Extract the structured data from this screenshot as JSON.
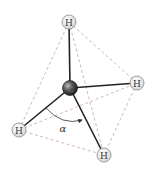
{
  "diagram": {
    "colors": {
      "bond": "#222222",
      "edge_dashed": "#c9a3a3",
      "hydrogen_fill": "#e6e6e6",
      "hydrogen_stroke": "#888888",
      "carbon_fill": "#3a3a3a",
      "angle_arc": "#333333"
    },
    "atoms": {
      "carbon": {
        "label": "C",
        "x": 70,
        "y": 88
      },
      "h_top": {
        "label": "H",
        "x": 69,
        "y": 22
      },
      "h_right": {
        "label": "H",
        "x": 137,
        "y": 83
      },
      "h_left": {
        "label": "H",
        "x": 19,
        "y": 130
      },
      "h_bottom": {
        "label": "H",
        "x": 104,
        "y": 155
      }
    },
    "angle": {
      "label": "α",
      "x": 63,
      "y": 128
    }
  }
}
